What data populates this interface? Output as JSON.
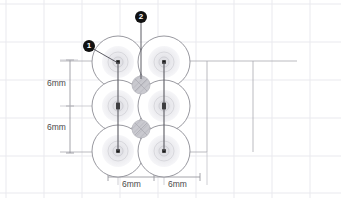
{
  "drawing": {
    "type": "technical-cad-drawing",
    "description": "Plan view of six circular elements arranged in a 2-column by 3-row grid with dimension annotations",
    "background_color": "#ffffff",
    "grid_color": "#e8e8ec",
    "construction_line_color": "#a9a9b0",
    "circle_outline_color": "#8c8c94",
    "ring_color": "#dedee2",
    "center_mark_color": "#1a1a1a",
    "hatched_circle_color": "#c9c9cf"
  },
  "callouts": [
    {
      "id": "callout-1",
      "label": "1",
      "x": 83,
      "y": 40,
      "leader_to_x": 118,
      "leader_to_y": 63
    },
    {
      "id": "callout-2",
      "label": "2",
      "x": 135,
      "y": 11,
      "leader_to_x": 141,
      "leader_to_y": 85
    }
  ],
  "dimensions": {
    "vertical": [
      {
        "id": "dim-vertical-upper",
        "value": "6mm",
        "label_x": 47,
        "label_y": 83
      },
      {
        "id": "dim-vertical-lower",
        "value": "6mm",
        "label_x": 47,
        "label_y": 127
      }
    ],
    "horizontal": [
      {
        "id": "dim-horizontal-left",
        "value": "6mm",
        "label_x": 131,
        "label_y": 184
      },
      {
        "id": "dim-horizontal-right",
        "value": "6mm",
        "label_x": 177,
        "label_y": 184
      }
    ]
  },
  "circles": [
    {
      "id": "circle-top-left",
      "cx": 118,
      "cy": 62,
      "r": 26
    },
    {
      "id": "circle-top-right",
      "cx": 164,
      "cy": 62,
      "r": 26
    },
    {
      "id": "circle-mid-left",
      "cx": 118,
      "cy": 106,
      "r": 26
    },
    {
      "id": "circle-mid-right",
      "cx": 164,
      "cy": 106,
      "r": 26
    },
    {
      "id": "circle-bottom-left",
      "cx": 118,
      "cy": 151,
      "r": 26
    },
    {
      "id": "circle-bottom-right",
      "cx": 164,
      "cy": 151,
      "r": 26
    }
  ],
  "hatched_circles": [
    {
      "id": "hatched-circle-upper",
      "cx": 141,
      "cy": 85,
      "r": 9
    },
    {
      "id": "hatched-circle-lower",
      "cx": 141,
      "cy": 129,
      "r": 9
    }
  ],
  "connector_lines": [
    {
      "id": "connector-left",
      "x1": 118,
      "y1": 62,
      "x2": 118,
      "y2": 151
    },
    {
      "id": "connector-right",
      "x1": 164,
      "y1": 62,
      "x2": 164,
      "y2": 151
    }
  ]
}
